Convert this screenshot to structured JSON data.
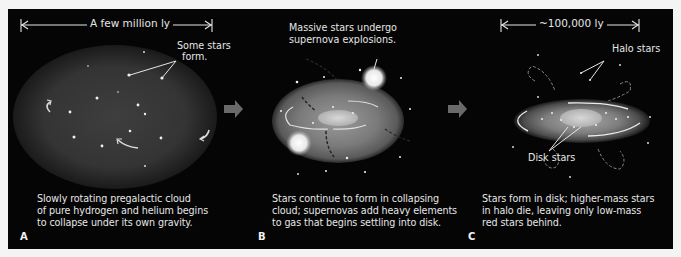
{
  "panels": [
    {
      "letter": "A",
      "scale_label": "A few million ly",
      "annotations": [
        "Some stars",
        "form."
      ],
      "caption": [
        "Slowly rotating pregalactic cloud",
        "of pure hydrogen and helium begins",
        "to collapse under its own gravity."
      ]
    },
    {
      "letter": "B",
      "annotations": [
        "Massive stars undergo",
        "supernova explosions."
      ],
      "caption": [
        "Stars continue to form in collapsing",
        "cloud; supernovas add heavy elements",
        "to gas that begins settling into disk."
      ]
    },
    {
      "letter": "C",
      "scale_label": "~100,000 ly",
      "annotations": [
        "Halo stars",
        "Disk stars"
      ],
      "caption": [
        "Stars form in disk; higher-mass stars",
        "in halo die, leaving only low-mass",
        "red stars behind."
      ]
    }
  ],
  "colors": {
    "background": "#050505",
    "page": "#f4f4f4",
    "text": "#e6e6e6",
    "arrow": "#6a6a6a"
  }
}
